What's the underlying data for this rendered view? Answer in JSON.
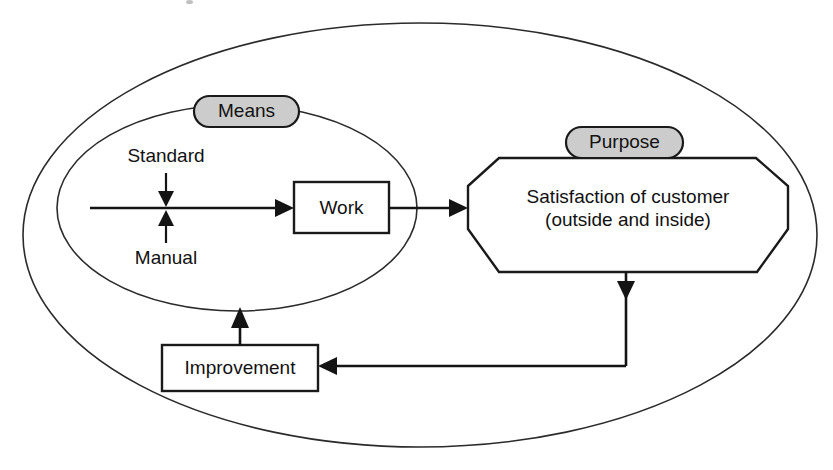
{
  "diagram": {
    "type": "flowchart",
    "colors": {
      "pill_fill": "#cccccc",
      "pill_stroke": "#1a1a1a",
      "node_fill": "#ffffff",
      "node_stroke": "#1a1a1a",
      "line": "#141414",
      "ellipse_stroke": "#2b2b2b",
      "background": "#ffffff"
    },
    "containers": [
      {
        "name": "outer-system-boundary",
        "shape": "ellipse",
        "label": ""
      },
      {
        "name": "means-boundary",
        "shape": "ellipse",
        "label": "Means"
      }
    ],
    "pills": [
      {
        "id": "means",
        "label": "Means"
      },
      {
        "id": "purpose",
        "label": "Purpose"
      }
    ],
    "nodes": [
      {
        "id": "work",
        "label": "Work",
        "shape": "rectangle"
      },
      {
        "id": "satisfaction",
        "label_line1": "Satisfaction of customer",
        "label_line2": "(outside and inside)",
        "shape": "hexagon"
      },
      {
        "id": "improvement",
        "label": "Improvement",
        "shape": "rectangle"
      }
    ],
    "annotations": [
      {
        "id": "standard",
        "label": "Standard",
        "arrow_direction": "down"
      },
      {
        "id": "manual",
        "label": "Manual",
        "arrow_direction": "up"
      }
    ],
    "edges": [
      {
        "from": "input-stream",
        "to": "work",
        "style": "arrow"
      },
      {
        "from": "work",
        "to": "satisfaction",
        "style": "arrow"
      },
      {
        "from": "satisfaction",
        "to": "improvement",
        "style": "arrow-feedback"
      },
      {
        "from": "improvement",
        "to": "means-boundary",
        "style": "arrow"
      }
    ]
  }
}
